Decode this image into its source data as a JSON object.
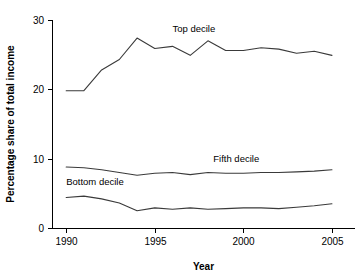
{
  "chart_data": {
    "type": "line",
    "title": "",
    "subtitle": "",
    "xlabel": "Year",
    "ylabel": "Percentage share of total income",
    "xlim": [
      1989.2,
      2006.3
    ],
    "ylim": [
      0,
      30
    ],
    "xticks": [
      1990,
      1995,
      2000,
      2005
    ],
    "yticks": [
      0,
      10,
      20,
      30
    ],
    "xtick_labels": [
      "1990",
      "1995",
      "2000",
      "2005"
    ],
    "ytick_labels": [
      "0",
      "10",
      "20",
      "30"
    ],
    "grid": false,
    "legend_position": "inline-labels",
    "x": [
      1990,
      1991,
      1992,
      1993,
      1994,
      1995,
      1996,
      1997,
      1998,
      1999,
      2000,
      2001,
      2002,
      2003,
      2004,
      2005
    ],
    "series": [
      {
        "name": "Top decile",
        "label": "Top decile",
        "color": "#3a3a3a",
        "values": [
          19.8,
          19.8,
          22.8,
          24.3,
          27.4,
          25.9,
          26.2,
          24.9,
          27.0,
          25.6,
          25.6,
          26.0,
          25.8,
          25.2,
          25.5,
          24.9
        ]
      },
      {
        "name": "Fifth decile",
        "label": "Fifth decile",
        "color": "#3a3a3a",
        "values": [
          8.8,
          8.7,
          8.4,
          8.0,
          7.6,
          7.9,
          8.0,
          7.7,
          8.0,
          7.9,
          7.9,
          8.0,
          8.0,
          8.1,
          8.2,
          8.4
        ]
      },
      {
        "name": "Bottom decile",
        "label": "Bottom decile",
        "color": "#3a3a3a",
        "values": [
          4.4,
          4.6,
          4.2,
          3.6,
          2.5,
          2.9,
          2.7,
          2.9,
          2.7,
          2.8,
          2.9,
          2.9,
          2.8,
          3.0,
          3.2,
          3.5
        ]
      }
    ],
    "annotations": [
      {
        "text": "Top decile",
        "x": 1996.0,
        "y": 28.3
      },
      {
        "text": "Fifth decile",
        "x": 1998.3,
        "y": 9.5
      },
      {
        "text": "Bottom decile",
        "x": 1990.0,
        "y": 6.2
      }
    ]
  }
}
